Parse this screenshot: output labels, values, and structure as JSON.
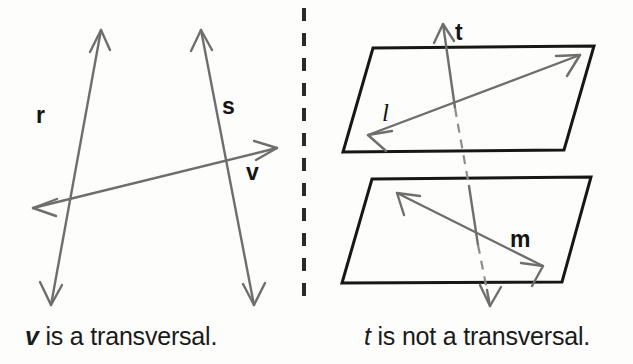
{
  "figure": {
    "background_color": "#fdfdfc",
    "line_color": "#6e6e6e",
    "plane_color": "#171717",
    "text_color": "#141414"
  },
  "left_panel": {
    "caption": {
      "symbol": "v",
      "rest": " is a transversal."
    },
    "labels": {
      "r": "r",
      "s": "s",
      "v": "v"
    },
    "lines": [
      {
        "name": "r",
        "kind": "double-arrow-line",
        "from": [
          51,
          305
        ],
        "to": [
          101,
          30
        ],
        "label_at": [
          36,
          123
        ]
      },
      {
        "name": "s",
        "kind": "double-arrow-line",
        "from": [
          254,
          305
        ],
        "to": [
          201,
          30
        ],
        "label_at": [
          222,
          114
        ]
      },
      {
        "name": "v",
        "kind": "double-arrow-line",
        "from": [
          33,
          208
        ],
        "to": [
          277,
          148
        ],
        "label_at": [
          246,
          180
        ]
      }
    ]
  },
  "divider": {
    "orientation": "vertical",
    "x": 304,
    "y1": 8,
    "y2": 300,
    "style": "dashed"
  },
  "right_panel": {
    "caption": {
      "symbol": "t",
      "rest": " is not a transversal."
    },
    "labels": {
      "t": "t",
      "l": "l",
      "m": "m"
    },
    "planes": [
      {
        "name": "upper-plane",
        "points": "373,48 594,46 564,150 343,152"
      },
      {
        "name": "lower-plane",
        "points": "372,179 591,177 562,282 342,283"
      }
    ],
    "lines": [
      {
        "name": "l",
        "kind": "double-arrow-line",
        "in_plane": "upper-plane",
        "from": [
          368,
          135
        ],
        "to": [
          580,
          55
        ],
        "label_at": [
          382,
          118
        ]
      },
      {
        "name": "m",
        "kind": "double-arrow-line",
        "in_plane": "lower-plane",
        "from": [
          397,
          193
        ],
        "to": [
          543,
          266
        ],
        "label_at": [
          510,
          247
        ]
      },
      {
        "name": "t",
        "kind": "double-arrow-line-piercing",
        "from": [
          443,
          24
        ],
        "to": [
          490,
          306
        ],
        "hidden_segments": [
          [
            455,
            108
          ],
          [
            478,
            245
          ]
        ],
        "label_at": [
          455,
          40
        ]
      }
    ]
  }
}
